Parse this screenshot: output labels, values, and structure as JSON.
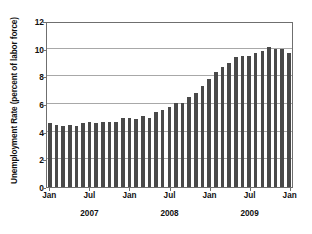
{
  "chart_data": {
    "type": "bar",
    "title": "",
    "subtitle": "",
    "xlabel": "",
    "ylabel": "Unemployment Rate (percent of labor force)",
    "ylim": [
      0,
      12
    ],
    "ytick_labels": [
      "0",
      "2",
      "4",
      "6",
      "8",
      "10",
      "12"
    ],
    "ytick_values": [
      0,
      2,
      4,
      6,
      8,
      10,
      12
    ],
    "grid": true,
    "legend": "none",
    "bar_color": "#494949",
    "frame_color": "#6f6f6f",
    "gridline_color": "#a8a8a8",
    "xtick_labels": [
      "Jan",
      "Jul",
      "Jan",
      "Jul",
      "Jan",
      "Jul",
      "Jan"
    ],
    "xtick_positions": [
      0,
      6,
      12,
      18,
      24,
      30,
      36
    ],
    "year_labels": [
      "2007",
      "2008",
      "2009"
    ],
    "categories": [
      "Jan 2007",
      "Feb 2007",
      "Mar 2007",
      "Apr 2007",
      "May 2007",
      "Jun 2007",
      "Jul 2007",
      "Aug 2007",
      "Sep 2007",
      "Oct 2007",
      "Nov 2007",
      "Dec 2007",
      "Jan 2008",
      "Feb 2008",
      "Mar 2008",
      "Apr 2008",
      "May 2008",
      "Jun 2008",
      "Jul 2008",
      "Aug 2008",
      "Sep 2008",
      "Oct 2008",
      "Nov 2008",
      "Dec 2008",
      "Jan 2009",
      "Feb 2009",
      "Mar 2009",
      "Apr 2009",
      "May 2009",
      "Jun 2009",
      "Jul 2009",
      "Aug 2009",
      "Sep 2009",
      "Oct 2009",
      "Nov 2009",
      "Dec 2009",
      "Jan 2010"
    ],
    "values": [
      4.6,
      4.5,
      4.4,
      4.5,
      4.4,
      4.6,
      4.7,
      4.6,
      4.7,
      4.7,
      4.7,
      5.0,
      5.0,
      4.9,
      5.1,
      5.0,
      5.4,
      5.6,
      5.8,
      6.1,
      6.1,
      6.5,
      6.8,
      7.3,
      7.8,
      8.3,
      8.7,
      9.0,
      9.4,
      9.5,
      9.5,
      9.7,
      9.8,
      10.1,
      10.0,
      10.0,
      9.7
    ]
  }
}
